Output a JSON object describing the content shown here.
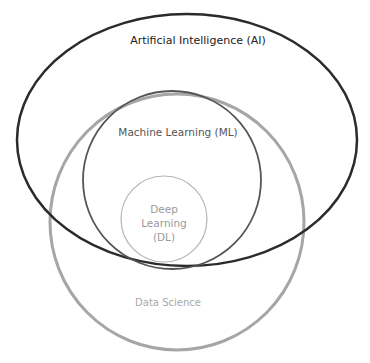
{
  "diagram": {
    "type": "venn",
    "sets": [
      {
        "id": "ai",
        "label": "Artificial Intelligence (AI)",
        "stroke": "#2b2b2b"
      },
      {
        "id": "ds",
        "label": "Data Science",
        "stroke": "#a6a6a6"
      },
      {
        "id": "ml",
        "label": "Machine Learning (ML)",
        "stroke": "#555555"
      },
      {
        "id": "dl",
        "label_lines": [
          "Deep",
          "Learning",
          "(DL)"
        ],
        "stroke": "#b5b5b5"
      }
    ],
    "relations": [
      "ML is subset of AI",
      "DL is subset of ML",
      "Data Science overlaps AI, contains ML and DL"
    ]
  }
}
